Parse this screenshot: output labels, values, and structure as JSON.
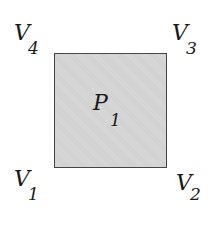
{
  "polygon": {
    "name": "P",
    "index": "1",
    "fill": "#d0d0d0",
    "stroke": "#444444"
  },
  "vertices": [
    {
      "name": "V",
      "index": "1",
      "position": "bottom-left"
    },
    {
      "name": "V",
      "index": "2",
      "position": "bottom-right"
    },
    {
      "name": "V",
      "index": "3",
      "position": "top-right"
    },
    {
      "name": "V",
      "index": "4",
      "position": "top-left"
    }
  ]
}
